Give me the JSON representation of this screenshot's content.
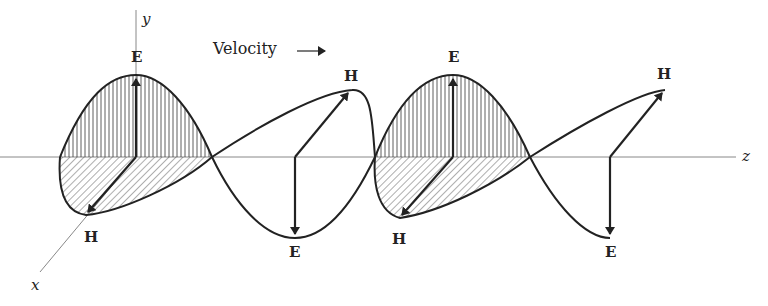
{
  "figure": {
    "axes": {
      "y_label": "y",
      "x_label": "x",
      "z_label": "z"
    },
    "velocity_label": "Velocity",
    "velocity_arrow": "→",
    "field_labels": {
      "e1": "E",
      "e2": "E",
      "e3": "E",
      "e4": "E",
      "h1": "H",
      "h2": "H",
      "h3": "H",
      "h4": "H"
    },
    "colors": {
      "ink": "#222222",
      "axis": "#777777",
      "background": "#ffffff"
    }
  }
}
